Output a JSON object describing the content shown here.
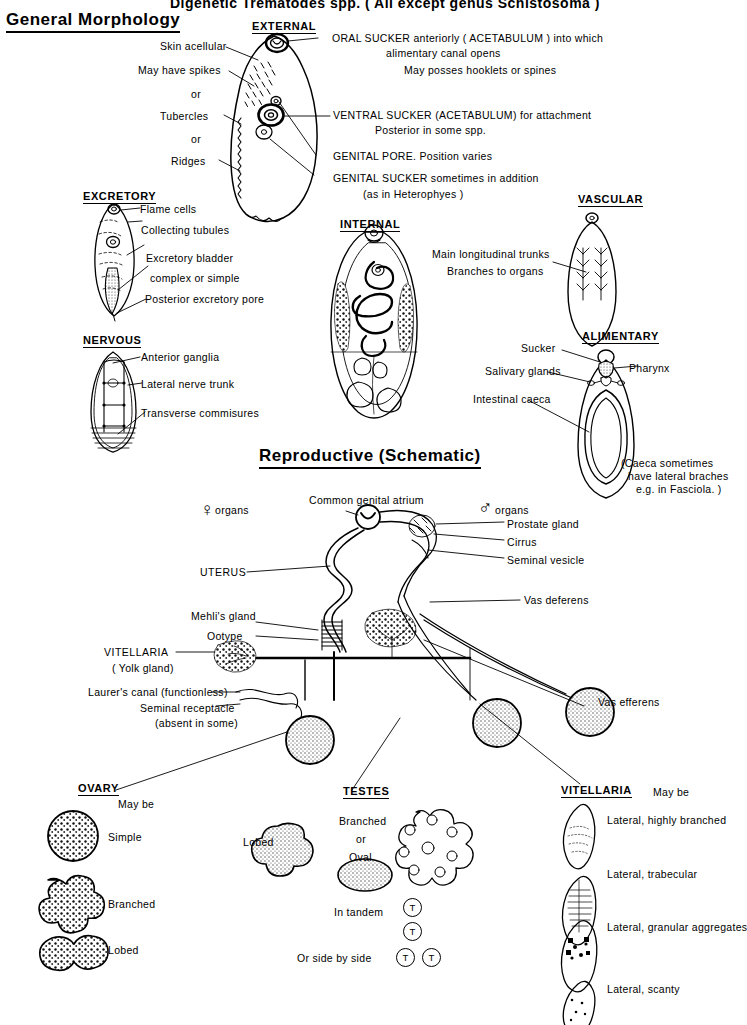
{
  "document": {
    "top_banner": "Digenetic Trematodes  spp.   ( All except genus  Schistosoma )",
    "title_left": "General  Morphology",
    "title_reproductive": "Reproductive  (Schematic)"
  },
  "sections": {
    "external": {
      "header": "EXTERNAL",
      "left_labels": [
        "Skin acellular",
        "May have spikes",
        "or",
        "Tubercles",
        "or",
        "Ridges"
      ],
      "right_labels": [
        "ORAL SUCKER  anteriorly  ( ACETABULUM ) into which",
        "alimentary  canal  opens",
        "May  posses  hooklets  or  spines",
        "VENTRAL SUCKER (ACETABULUM) for  attachment",
        "Posterior  in  some  spp.",
        "GENITAL   PORE. Position  varies",
        "GENITAL   SUCKER  sometimes  in   addition",
        "(as in  Heterophyes )"
      ]
    },
    "excretory": {
      "header": "EXCRETORY",
      "labels": [
        "Flame cells",
        "Collecting  tubules",
        "Excretory bladder",
        "complex  or  simple",
        "Posterior  excretory  pore"
      ]
    },
    "nervous": {
      "header": "NERVOUS",
      "labels": [
        "Anterior  ganglia",
        "Lateral  nerve  trunk",
        "Transverse  commisures"
      ]
    },
    "internal": {
      "header": "INTERNAL"
    },
    "vascular": {
      "header": "VASCULAR",
      "labels": [
        "Main   longitudinal  trunks",
        "Branches to organs"
      ]
    },
    "alimentary": {
      "header": "ALIMENTARY",
      "labels": [
        "Sucker",
        "Pharynx",
        "Salivary glands",
        "Intestinal caeca"
      ],
      "note": [
        "(Caeca   sometimes",
        "have lateral  braches",
        "e.g. in  Fasciola. )"
      ]
    },
    "reproductive": {
      "female_symbol": "♀",
      "female_label": "organs",
      "male_symbol": "♂",
      "male_label": "organs",
      "labels": [
        "Common  genital  atrium",
        "Prostate  gland",
        "Cirrus",
        "Seminal  vesicle",
        "UTERUS",
        "Vas  deferens",
        "Mehli's  gland",
        "Ootype",
        "VITELLARIA",
        "( Yolk gland)",
        "Laurer's canal (functionless)",
        "Seminal receptacle",
        "(absent in some)",
        "Vas  efferens"
      ]
    },
    "ovary": {
      "header": "OVARY",
      "may_be": "May  be",
      "forms": [
        "Simple",
        "Branched",
        "Lobed"
      ]
    },
    "testes": {
      "header": "TESTES",
      "forms": [
        "Lobed",
        "Branched",
        "or",
        "Oval"
      ],
      "arrangements": [
        "In  tandem",
        "Or  side  by  side"
      ],
      "marker": "T"
    },
    "vitellaria": {
      "header": "VITELLARIA",
      "may_be": "May  be",
      "forms": [
        "Lateral, highly  branched",
        "Lateral, trabecular",
        "Lateral, granular  aggregates",
        "Lateral, scanty"
      ]
    }
  },
  "colors": {
    "ink": "#000000",
    "paper": "#ffffff",
    "fill_light": "#f2f2f2"
  }
}
